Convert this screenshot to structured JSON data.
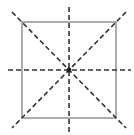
{
  "diagram": {
    "colors": {
      "square_stroke": "#8a8a8a",
      "dashed_line": "#333333",
      "center_point": "#222222",
      "background": "#ffffff"
    },
    "square": {
      "x1": 22,
      "y1": 22,
      "x2": 116,
      "y2": 118
    },
    "center": {
      "x": 69,
      "y": 70
    },
    "lines_of_symmetry": [
      {
        "name": "horizontal",
        "x1": 8,
        "y1": 70,
        "x2": 131,
        "y2": 70
      },
      {
        "name": "vertical",
        "x1": 69,
        "y1": 7,
        "x2": 69,
        "y2": 133
      },
      {
        "name": "diagonal-main",
        "x1": 12,
        "y1": 12,
        "x2": 126,
        "y2": 128
      },
      {
        "name": "diagonal-anti",
        "x1": 126,
        "y1": 12,
        "x2": 12,
        "y2": 128
      }
    ],
    "count_lines_of_symmetry": 4
  }
}
